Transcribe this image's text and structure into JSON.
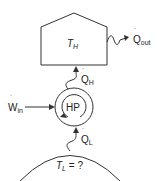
{
  "diagram": {
    "type": "heat-pump-schematic",
    "nodes": {
      "house": {
        "label_main": "T",
        "label_sub": "H"
      },
      "heat_pump": {
        "label": "HP"
      },
      "ground": {
        "label_main": "T",
        "label_sub": "L",
        "label_suffix": " = ?"
      }
    },
    "flows": {
      "q_out": {
        "label_main": "Q",
        "label_sub": "out",
        "dot": "˙"
      },
      "q_h": {
        "label_main": "Q",
        "label_sub": "H",
        "dot": "˙"
      },
      "w_in": {
        "label_main": "W",
        "label_sub": "in",
        "dot": "˙"
      },
      "q_l": {
        "label_main": "Q",
        "label_sub": "L",
        "dot": "˙"
      }
    },
    "colors": {
      "stroke": "#333333",
      "text": "#222222",
      "background": "#ffffff"
    }
  }
}
